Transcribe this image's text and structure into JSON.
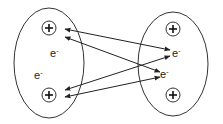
{
  "diagram": {
    "type": "atomic electron sharing / bonding diagram",
    "atoms": [
      {
        "id": "left",
        "cx": 49,
        "cy": 63,
        "rx": 35,
        "ry": 55,
        "nuclei": [
          {
            "x": 49,
            "y": 28,
            "symbol": "+"
          },
          {
            "x": 49,
            "y": 95,
            "symbol": "+"
          }
        ],
        "electrons": [
          {
            "x": 50,
            "y": 47,
            "label": "e",
            "sup": "-"
          },
          {
            "x": 34,
            "y": 69,
            "label": "e",
            "sup": "-"
          }
        ]
      },
      {
        "id": "right",
        "cx": 173,
        "cy": 64,
        "rx": 35,
        "ry": 52,
        "nuclei": [
          {
            "x": 173,
            "y": 29,
            "symbol": "+"
          },
          {
            "x": 173,
            "y": 95,
            "symbol": "+"
          }
        ],
        "electrons": [
          {
            "x": 172,
            "y": 47,
            "label": "e",
            "sup": "-"
          },
          {
            "x": 160,
            "y": 68,
            "label": "e",
            "sup": "-"
          }
        ]
      }
    ],
    "arrows": [
      {
        "from": [
          65,
          29
        ],
        "to": [
          170,
          50
        ],
        "bidirectional": true
      },
      {
        "from": [
          65,
          37
        ],
        "to": [
          160,
          72
        ],
        "bidirectional": true
      },
      {
        "from": [
          65,
          90
        ],
        "to": [
          170,
          56
        ],
        "bidirectional": true
      },
      {
        "from": [
          65,
          97
        ],
        "to": [
          160,
          77
        ],
        "bidirectional": true
      }
    ],
    "labels": {
      "electron": "e",
      "electron_charge": "-",
      "nucleus": "+"
    },
    "colors": {
      "stroke": "#333333",
      "background": "#ffffff"
    }
  }
}
